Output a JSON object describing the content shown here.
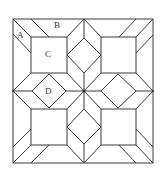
{
  "figure": {
    "labels": {
      "A": "A",
      "B": "B",
      "C": "C",
      "D": "D"
    },
    "colors": {
      "line": "#3a3a3a",
      "background": "#ffffff"
    }
  }
}
